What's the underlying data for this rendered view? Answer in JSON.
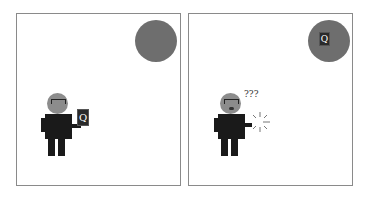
{
  "panels": [
    {
      "id": "panel-1",
      "ball": {
        "color": "#6e6e6e",
        "has_card": false
      },
      "person": {
        "holding_card": true,
        "card_letter": "Q"
      }
    },
    {
      "id": "panel-2",
      "ball": {
        "color": "#6e6e6e",
        "has_card": true,
        "card_letter": "Q"
      },
      "person": {
        "holding_card": false,
        "thought": "???",
        "sparkle": true
      }
    }
  ],
  "colors": {
    "ball": "#6e6e6e",
    "head": "#8c8c8c",
    "body": "#1a1a1a",
    "border": "#8a8a8a"
  }
}
